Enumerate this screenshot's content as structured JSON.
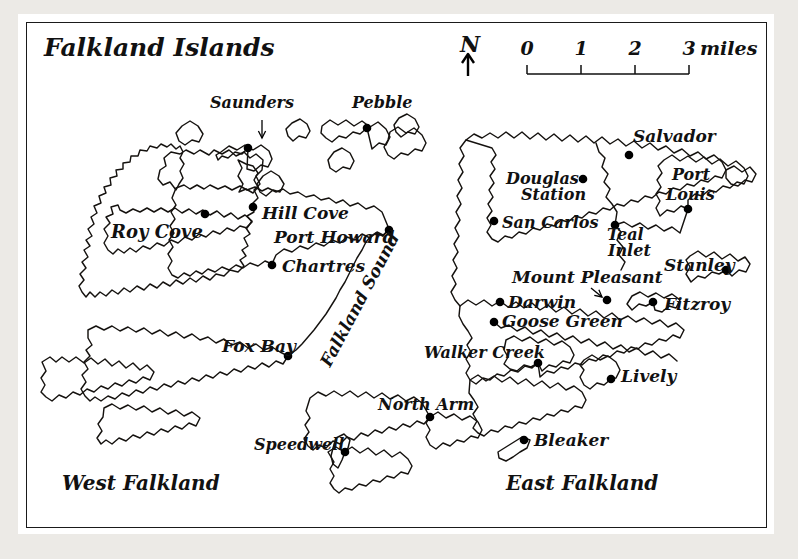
{
  "figure": {
    "title": "Falkland Islands",
    "kind": "map",
    "background_color": "#eceae6",
    "paper_color": "#ffffff",
    "ink_color": "#15120f"
  },
  "compass": {
    "label": "N",
    "icon": "north-arrow-icon"
  },
  "scale": {
    "ticks": [
      "0",
      "1",
      "2",
      "3"
    ],
    "units_label": "miles",
    "full_label": "3 miles"
  },
  "region_labels": [
    {
      "name": "west-falkland",
      "text": "West Falkland",
      "x": 62,
      "y": 490,
      "size": 20,
      "rotate": 0
    },
    {
      "name": "east-falkland",
      "text": "East Falkland",
      "x": 506,
      "y": 490,
      "size": 20,
      "rotate": 0
    },
    {
      "name": "falkland-sound",
      "text": "Falkland Sound",
      "x": 330,
      "y": 368,
      "size": 17,
      "rotate": -62
    }
  ],
  "settlements": [
    {
      "name": "saunders",
      "text": "Saunders",
      "dot": [
        248,
        148
      ],
      "label": [
        210,
        108
      ],
      "anchor": "start",
      "size": 16,
      "pointer": [
        262,
        120,
        262,
        138
      ]
    },
    {
      "name": "pebble",
      "text": "Pebble",
      "dot": [
        367,
        128
      ],
      "label": [
        352,
        108
      ],
      "anchor": "start",
      "size": 16
    },
    {
      "name": "hill-cove",
      "text": "Hill Cove",
      "dot": [
        253,
        207
      ],
      "label": [
        262,
        219
      ],
      "anchor": "start",
      "size": 17
    },
    {
      "name": "roy-cove",
      "text": "Roy Cove",
      "dot": [
        205,
        214
      ],
      "label": [
        111,
        238
      ],
      "anchor": "start",
      "size": 18
    },
    {
      "name": "port-howard",
      "text": "Port Howard",
      "dot": [
        389,
        230
      ],
      "label": [
        274,
        243
      ],
      "anchor": "start",
      "size": 17
    },
    {
      "name": "chartres",
      "text": "Chartres",
      "dot": [
        272,
        265
      ],
      "label": [
        282,
        272
      ],
      "anchor": "start",
      "size": 17
    },
    {
      "name": "fox-bay",
      "text": "Fox Bay",
      "dot": [
        288,
        356
      ],
      "label": [
        222,
        352
      ],
      "anchor": "start",
      "size": 17
    },
    {
      "name": "speedwell",
      "text": "Speedwell",
      "dot": [
        345,
        452
      ],
      "label": [
        254,
        450
      ],
      "anchor": "start",
      "size": 16
    },
    {
      "name": "north-arm",
      "text": "North Arm",
      "dot": [
        430,
        417
      ],
      "label": [
        378,
        410
      ],
      "anchor": "start",
      "size": 16
    },
    {
      "name": "san-carlos",
      "text": "San Carlos",
      "dot": [
        494,
        221
      ],
      "label": [
        502,
        228
      ],
      "anchor": "start",
      "size": 16
    },
    {
      "name": "douglas-station",
      "text": "Douglas",
      "dot": [
        583,
        179
      ],
      "label": [
        506,
        184
      ],
      "anchor": "start",
      "size": 16
    },
    {
      "name": "douglas-station-line2",
      "text": "Station",
      "dot": null,
      "label": [
        521,
        200
      ],
      "anchor": "start",
      "size": 16
    },
    {
      "name": "salvador",
      "text": "Salvador",
      "dot": [
        629,
        155
      ],
      "label": [
        633,
        142
      ],
      "anchor": "start",
      "size": 17
    },
    {
      "name": "port-louis",
      "text": "Port",
      "dot": [
        688,
        209
      ],
      "label": [
        672,
        180
      ],
      "anchor": "start",
      "size": 16
    },
    {
      "name": "port-louis-line2",
      "text": "Louis",
      "dot": null,
      "label": [
        666,
        200
      ],
      "anchor": "start",
      "size": 16
    },
    {
      "name": "teal-inlet",
      "text": "Teal",
      "dot": [
        615,
        225
      ],
      "label": [
        607,
        240
      ],
      "anchor": "start",
      "size": 16
    },
    {
      "name": "teal-inlet-line2",
      "text": "Inlet",
      "dot": null,
      "label": [
        608,
        256
      ],
      "anchor": "start",
      "size": 16
    },
    {
      "name": "mount-pleasant",
      "text": "Mount Pleasant",
      "dot": [
        607,
        300
      ],
      "label": [
        512,
        283
      ],
      "anchor": "start",
      "size": 17,
      "pointer": [
        591,
        288,
        602,
        297
      ]
    },
    {
      "name": "darwin",
      "text": "Darwin",
      "dot": [
        500,
        302
      ],
      "label": [
        508,
        308
      ],
      "anchor": "start",
      "size": 17
    },
    {
      "name": "goose-green",
      "text": "Goose Green",
      "dot": [
        494,
        322
      ],
      "label": [
        502,
        327
      ],
      "anchor": "start",
      "size": 17
    },
    {
      "name": "stanley",
      "text": "Stanley",
      "dot": [
        726,
        270
      ],
      "label": [
        664,
        271
      ],
      "anchor": "start",
      "size": 17
    },
    {
      "name": "fitzroy",
      "text": "Fitzroy",
      "dot": [
        653,
        302
      ],
      "label": [
        664,
        310
      ],
      "anchor": "start",
      "size": 17
    },
    {
      "name": "walker-creek",
      "text": "Walker Creek",
      "dot": [
        538,
        363
      ],
      "label": [
        424,
        358
      ],
      "anchor": "start",
      "size": 16
    },
    {
      "name": "lively",
      "text": "Lively",
      "dot": [
        611,
        379
      ],
      "label": [
        621,
        382
      ],
      "anchor": "start",
      "size": 17
    },
    {
      "name": "bleaker",
      "text": "Bleaker",
      "dot": [
        524,
        440
      ],
      "label": [
        534,
        446
      ],
      "anchor": "start",
      "size": 17
    }
  ],
  "coastlines": [
    {
      "name": "west-falkland-main",
      "d": "M176,190 L170,182 L163,185 L158,179 L160,170 L166,166 L164,158 L171,152 L180,154 L186,150 L194,154 L200,150 L209,155 L214,150 L222,154 L229,150 L236,156 L244,152 L250,158 L256,154 L263,160 L262,170 L256,176 L260,184 L254,190 L258,198 L252,204 L254,212 L247,216 L252,222 L246,228 L250,234 L244,238 L248,246 L242,250 L246,256 L240,260 L244,266 L238,272 L230,270 L224,276 L216,274 L210,280 L203,276 L196,282 L190,278 L183,284 L176,280 L170,286 L163,282 L157,288 L150,284 L144,290 L137,286 L130,292 L124,288 L118,294 L112,290 L106,296 L100,292 L95,297 L90,292 L86,297 L82,292 L79,286 L84,280 L80,274 L86,268 L82,262 L88,257 L84,250 L90,246 L86,240 L92,236 L88,229 L94,224 L91,217 L97,213 L94,206 L101,203 L99,196 L106,193 L104,187 L111,185 L110,178 L117,176 L116,170 L123,169 L123,163 L130,162 L131,156 L138,156 L140,150 L147,151 L150,146 L157,148 L161,144 L167,147 L171,144 L176,149 L180,146 L183,152 L180,158 L184,164 L180,171 L183,178 L179,184 Z"
    },
    {
      "name": "west-falkland-north-lobe",
      "d": "M176,188 L184,185 L190,189 L197,185 L204,189 L210,185 L218,189 L225,186 L232,190 L240,186 L247,190 L255,187 L262,191 L268,188 L276,192 L283,189 L290,194 L298,192 L306,197 L314,195 L321,200 L329,198 L336,203 L343,200 L350,206 L358,203 L366,209 L374,206 L382,212 L389,229 L383,236 L376,233 L370,238 L362,234 L355,240 L347,237 L340,243 L332,240 L324,246 L316,243 L308,249 L300,246 L292,252 L284,249 L276,255 L272,264 L265,261 L258,266 L250,263 L243,268 L236,265 L229,270 L222,267 L215,272 L208,269 L202,274 L196,271 L190,276 L184,273 L178,278 L172,275 L168,268 L172,261 L168,254 L173,247 L169,240 L174,233 L170,226 L175,219 L171,212 L176,205 L172,198 Z"
    },
    {
      "name": "west-falkland-northwest",
      "d": "M126,213 L133,209 L140,212 L147,208 L154,212 L161,208 L168,212 L175,208 L182,213 L189,209 L196,214 L203,210 L210,215 L217,211 L224,217 L231,213 L238,219 L245,215 L252,221 L247,228 L240,226 L234,231 L227,228 L220,234 L213,231 L206,237 L199,234 L192,240 L185,237 L178,243 L171,240 L164,246 L157,243 L150,249 L143,246 L136,252 L130,248 L124,253 L118,249 L113,254 L108,250 L104,243 L108,236 L104,229 L110,223 L106,217 L113,214 L111,207 L118,205 L120,210 Z"
    },
    {
      "name": "west-falkland-south",
      "d": "M88,330 L96,326 L104,330 L112,326 L120,331 L128,327 L136,332 L144,328 L152,334 L160,330 L168,336 L176,332 L184,338 L192,334 L200,340 L208,337 L216,343 L224,339 L232,345 L240,342 L248,348 L256,344 L264,350 L272,347 L280,352 L288,356 L283,364 L276,361 L269,367 L262,363 L255,369 L248,366 L241,372 L234,369 L227,375 L220,372 L213,378 L206,375 L199,381 L192,378 L185,384 L178,381 L171,387 L164,384 L157,390 L150,387 L143,393 L136,390 L129,396 L122,393 L115,399 L108,396 L101,401 L95,397 L90,401 L85,396 L81,389 L86,382 L82,375 L88,369 L84,362 L90,356 L86,350 L92,345 L88,338 Z"
    },
    {
      "name": "west-falkland-far-southwest",
      "d": "M42,362 L50,357 L56,362 L62,357 L69,362 L76,357 L84,363 L91,358 L98,364 L105,359 L112,366 L119,361 L126,368 L133,363 L140,370 L147,365 L154,372 L150,380 L143,377 L136,383 L129,380 L122,386 L115,383 L108,389 L101,386 L94,392 L87,389 L80,395 L73,392 L66,398 L59,395 L52,401 L46,397 L41,392 L45,385 L41,378 L46,371 Z"
    },
    {
      "name": "west-falkland-south-tail",
      "d": "M104,408 L112,404 L120,409 L128,405 L136,410 L144,406 L152,412 L160,408 L168,414 L176,410 L184,416 L192,412 L200,418 L196,426 L189,423 L182,429 L175,426 L168,432 L161,429 L154,435 L147,432 L140,438 L133,435 L126,441 L119,438 L112,444 L106,440 L101,444 L97,438 L102,431 L98,424 L103,417 Z"
    },
    {
      "name": "west-falkland-sound-coast",
      "d": "M288,356 L296,350 L302,344 L308,337 L314,330 L320,322 L326,314 L331,306 L336,298 L340,290 L345,282 L349,274 L353,266 L357,258 L362,250 L366,242 L371,236 L377,232 L383,235 L389,230"
    },
    {
      "name": "lafonia-west",
      "d": "M310,398 L318,392 L326,396 L334,391 L342,396 L350,391 L358,397 L366,392 L374,398 L382,393 L390,399 L398,395 L406,401 L414,397 L422,403 L430,417 L424,424 L417,421 L410,427 L403,424 L396,430 L389,427 L382,433 L375,430 L368,436 L361,433 L354,440 L347,437 L340,444 L333,441 L326,448 L319,445 L313,450 L308,446 L304,439 L309,432 L305,425 L310,418 L306,411 Z"
    },
    {
      "name": "lafonia-south",
      "d": "M328,452 L336,447 L344,452 L352,447 L360,453 L368,448 L376,455 L384,450 L392,457 L400,452 L408,459 L412,466 L408,474 L401,472 L394,478 L387,476 L380,482 L373,480 L366,486 L359,484 L352,490 L345,488 L339,493 L334,489 L330,483 L334,476 L330,469 L334,462 Z"
    },
    {
      "name": "east-falkland-main",
      "d": "M466,140 L474,134 L482,138 L490,133 L498,138 L506,132 L514,138 L522,132 L530,139 L538,133 L546,140 L554,134 L562,141 L570,135 L578,142 L586,136 L594,143 L602,137 L610,144 L618,139 L626,146 L634,141 L642,148 L650,143 L658,150 L666,146 L674,153 L682,149 L690,156 L698,152 L706,159 L714,155 L722,162 L726,170 L722,178 L715,176 L708,182 L701,180 L694,186 L687,184 L680,190 L673,188 L666,194 L659,192 L652,198 L645,196 L638,202 L631,200 L624,206 L617,204 L610,210 L603,208 L596,214 L589,212 L582,218 L575,216 L568,222 L561,220 L554,226 L547,224 L540,230 L533,228 L526,234 L519,232 L512,238 L505,236 L498,242 L492,239 L487,232 L491,225 L487,218 L492,211 L488,204 L493,197 L489,190 L494,183 L490,176 L495,169 L491,162 L496,155 L492,148 Z"
    },
    {
      "name": "east-falkland-north-coast",
      "d": "M466,140 L460,148 L464,156 L459,164 L463,172 L458,180 L462,188 L457,196 L461,204 L456,212 L460,220 L455,228 L459,236 L454,244 L458,252 L453,260 L457,268 L452,276 L456,284 L451,292 L455,300 L460,306"
    },
    {
      "name": "east-falkland-south-coast",
      "d": "M460,306 L468,300 L476,305 L484,300 L492,306 L500,301 L508,307 L516,302 L524,308 L532,303 L540,310 L548,305 L556,312 L564,307 L572,314 L580,309 L588,316 L596,311 L604,318 L612,313 L620,320 L628,316 L636,322 L644,318 L652,324 L660,320 L668,327 L676,323 L684,330 L680,338 L673,335 L666,341 L659,339 L652,345 L645,343 L638,349 L631,347 L624,353 L617,351 L610,357 L603,355 L596,361 L589,359 L582,365 L575,363 L568,369 L561,367 L554,373 L547,371 L540,377 L538,363 L532,368 L525,366 L518,372 L511,370 L504,376 L497,374 L490,380 L483,378 L476,384 L470,380 L466,373 L470,366 L466,359 L471,352 L467,345 L472,338 L468,331 L463,324 L459,316 Z"
    },
    {
      "name": "east-falkland-isthmus",
      "d": "M494,322 L501,328 L509,325 L517,331 L525,327 L533,334 L541,330 L549,337 L557,333 L565,340 L573,336 L581,343 L589,339 L597,346 L605,342 L613,349 L621,345 L629,352 L637,348 L645,355 L653,351 L661,358 L669,354 L677,361"
    },
    {
      "name": "east-falkland-southeast-lobe",
      "d": "M470,380 L478,375 L486,381 L494,376 L502,382 L510,377 L518,384 L526,379 L534,386 L542,381 L550,388 L558,383 L566,390 L574,386 L582,392 L586,400 L582,408 L575,406 L568,412 L561,410 L554,416 L547,414 L540,420 L533,418 L526,424 L519,422 L512,428 L505,426 L498,432 L491,430 L484,436 L478,433 L473,428 L477,421 L473,414 L478,407 L474,400 L469,393 Z"
    },
    {
      "name": "salvador-inlet",
      "d": "M596,143 L599,152 L605,158 L602,167 L608,174 L604,182 L610,189 L606,197 L612,204 L617,212 L615,225 L621,232 L617,240 L623,247 L619,255 L625,262 L621,270"
    },
    {
      "name": "teal-inlet-channel",
      "d": "M615,225 L624,222 L632,227 L640,223 L648,229 L656,225 L664,231 L672,227 L680,233 L688,209"
    },
    {
      "name": "port-louis-peninsula",
      "d": "M664,160 L672,155 L680,161 L688,156 L696,162 L704,157 L712,164 L720,159 L728,166 L736,161 L744,168 L748,176 L744,184 L737,182 L730,188 L723,186 L716,192 L709,190 L702,196 L695,194 L688,200 L688,209 L681,206 L674,212 L667,210 L660,216 L656,208 L660,201 L656,194 L661,187 L657,180 L662,173 L658,166 Z"
    },
    {
      "name": "stanley-peninsula",
      "d": "M690,256 L698,251 L706,257 L714,252 L722,259 L730,254 L738,261 L745,257 L750,264 L746,272 L739,270 L732,276 L726,270 L719,274 L712,272 L705,278 L698,276 L691,282 L686,274 L690,267 L686,260 Z"
    },
    {
      "name": "fitzroy-inlet",
      "d": "M632,296 L640,292 L648,297 L656,293 L664,298 L672,294 L680,300 L676,308 L669,306 L662,312 L655,310 L653,302 L646,306 L639,304 L632,310 L627,304 Z"
    },
    {
      "name": "saunders-island",
      "d": "M221,152 L229,146 L237,150 L245,145 L253,150 L261,145 L269,151 L272,159 L268,167 L261,165 L254,171 L247,169 L248,148 L242,154 L235,152 L228,158 L222,156 L218,160 L216,155 Z"
    },
    {
      "name": "saunders-neck",
      "d": "M238,160 L242,168 L238,176 L243,184 L239,192 L246,189 L253,193 L258,187 L254,180 L258,173 L253,166 L246,164 Z"
    },
    {
      "name": "keppel-island",
      "d": "M182,126 L190,121 L198,126 L203,134 L199,142 L192,140 L185,145 L179,141 L176,133 Z"
    },
    {
      "name": "pebble-island",
      "d": "M322,126 L330,120 L338,125 L346,120 L354,126 L362,121 L370,127 L378,122 L386,129 L390,137 L386,145 L379,143 L372,149 L367,128 L360,134 L353,132 L346,138 L339,136 L332,142 L326,138 L321,133 Z"
    },
    {
      "name": "pebble-east",
      "d": "M390,132 L398,127 L406,133 L414,128 L422,135 L426,143 L422,151 L415,149 L408,155 L401,153 L394,159 L388,155 L384,147 L388,140 Z"
    },
    {
      "name": "small-island-a",
      "d": "M263,176 L271,171 L279,176 L284,184 L280,192 L273,190 L266,196 L260,192 L257,184 Z"
    },
    {
      "name": "small-island-b",
      "d": "M292,123 L300,119 L307,124 L310,131 L306,138 L299,136 L293,141 L288,136 L286,129 Z"
    },
    {
      "name": "small-island-c",
      "d": "M334,152 L342,148 L350,153 L354,161 L350,169 L343,167 L336,172 L330,168 L328,160 Z"
    },
    {
      "name": "small-island-d",
      "d": "M399,118 L407,114 L415,119 L419,127 L415,134 L408,132 L401,137 L396,132 L394,125 Z"
    },
    {
      "name": "lively-island",
      "d": "M584,360 L592,355 L600,360 L608,356 L616,362 L620,370 L616,378 L611,379 L604,385 L597,383 L590,389 L584,385 L580,377 L584,370 L580,365 Z"
    },
    {
      "name": "bleaker-island",
      "d": "M498,452 L506,447 L514,442 L522,437 L530,440 L527,448 L520,452 L513,457 L506,461 L499,458 Z"
    },
    {
      "name": "speedwell-island",
      "d": "M336,438 L344,434 L350,440 L348,448 L345,452 L342,460 L338,468 L333,464 L331,456 L333,448 Z"
    },
    {
      "name": "walker-creek-coast",
      "d": "M506,340 L514,336 L522,341 L530,337 L538,343 L546,339 L554,345 L562,341 L570,347 L574,355 L570,363 L563,361 L556,367 L549,365 L542,371 L538,363 L531,367 L524,365 L517,371 L510,369 L504,364 L508,357 L504,350 Z"
    },
    {
      "name": "east-falkland-far-east",
      "d": "M726,170 L734,166 L742,172 L750,167 L756,174 L752,182 L745,180 L738,186 L731,184 L726,178 Z"
    },
    {
      "name": "north-arm-bay",
      "d": "M430,417 L438,412 L446,418 L454,414 L462,420 L470,416 L478,422 L482,430 L478,438 L471,436 L464,442 L457,440 L450,446 L443,443 L436,449 L430,445 L426,437 L430,430 L426,423 Z"
    }
  ]
}
